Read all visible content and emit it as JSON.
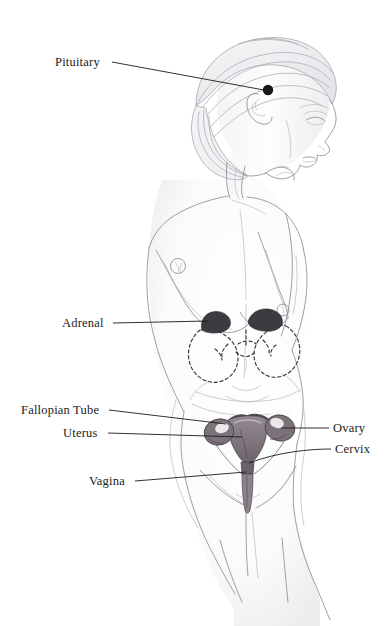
{
  "page": {
    "background_color": "#ffffff",
    "width": 391,
    "height": 626
  },
  "illustration": {
    "name": "female-figure-illustration",
    "medium": "pencil sketch",
    "subject": "standing female figure, three-quarter rear-side view",
    "line_color": "#8e8e96",
    "organ_color": "#6d646c",
    "dashed_outline_color": "#3a3a3a",
    "marker_color": "#17171a"
  },
  "labels": [
    {
      "id": "pituitary",
      "text": "Pituitary",
      "text_x": 55,
      "text_y": 66,
      "anchor": "start",
      "leader_from_x": 112,
      "leader_from_y": 62,
      "leader_to_x": 264,
      "leader_to_y": 90
    },
    {
      "id": "adrenal",
      "text": "Adrenal",
      "text_x": 62,
      "text_y": 327,
      "anchor": "start",
      "leader_from_x": 113,
      "leader_from_y": 323,
      "leader_to_x": 208,
      "leader_to_y": 321
    },
    {
      "id": "fallopian-tube",
      "text": "Fallopian Tube",
      "text_x": 21,
      "text_y": 414,
      "anchor": "start",
      "leader_from_x": 109,
      "leader_from_y": 410,
      "leader_to_x": 226,
      "leader_to_y": 424
    },
    {
      "id": "uterus",
      "text": "Uterus",
      "text_x": 63,
      "text_y": 437,
      "anchor": "start",
      "leader_from_x": 108,
      "leader_from_y": 433,
      "leader_to_x": 242,
      "leader_to_y": 437
    },
    {
      "id": "ovary",
      "text": "Ovary",
      "text_x": 333,
      "text_y": 432,
      "anchor": "start",
      "leader_from_x": 329,
      "leader_from_y": 428,
      "leader_to_x": 281,
      "leader_to_y": 428
    },
    {
      "id": "cervix",
      "text": "Cervix",
      "text_x": 335,
      "text_y": 453,
      "anchor": "start",
      "leader_from_x": 331,
      "leader_from_y": 449,
      "leader_to_x": 249,
      "leader_to_y": 463
    },
    {
      "id": "vagina",
      "text": "Vagina",
      "text_x": 89,
      "text_y": 485,
      "anchor": "start",
      "leader_from_x": 135,
      "leader_from_y": 481,
      "leader_to_x": 246,
      "leader_to_y": 472
    }
  ],
  "organs": [
    {
      "id": "pituitary-gland",
      "name": "pituitary gland",
      "marker": "filled dot",
      "x": 268,
      "y": 90
    },
    {
      "id": "adrenal-left",
      "name": "left adrenal gland",
      "marker": "dark cap on kidney",
      "x": 214,
      "y": 322
    },
    {
      "id": "adrenal-right",
      "name": "right adrenal gland",
      "marker": "dark cap on kidney",
      "x": 256,
      "y": 318
    },
    {
      "id": "kidney-left",
      "name": "left kidney",
      "marker": "dashed outline",
      "x": 216,
      "y": 345
    },
    {
      "id": "kidney-right",
      "name": "right kidney",
      "marker": "dashed outline",
      "x": 266,
      "y": 343
    },
    {
      "id": "uterus-body",
      "name": "uterus",
      "marker": "solid shaded organ",
      "x": 247,
      "y": 437
    },
    {
      "id": "ovary-left",
      "name": "left ovary",
      "marker": "solid shaded oval",
      "x": 219,
      "y": 432
    },
    {
      "id": "ovary-right",
      "name": "right ovary",
      "marker": "solid shaded oval",
      "x": 279,
      "y": 428
    },
    {
      "id": "fallopian-tube-left",
      "name": "left fallopian tube",
      "marker": "curved tube",
      "x": 228,
      "y": 423
    },
    {
      "id": "fallopian-tube-right",
      "name": "right fallopian tube",
      "marker": "curved tube",
      "x": 268,
      "y": 421
    },
    {
      "id": "cervix-part",
      "name": "cervix",
      "marker": "narrow neck below uterus",
      "x": 248,
      "y": 462
    },
    {
      "id": "vagina-canal",
      "name": "vagina",
      "marker": "vertical canal",
      "x": 247,
      "y": 478
    }
  ]
}
